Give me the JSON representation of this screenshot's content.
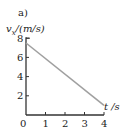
{
  "panel_label": "a)",
  "axes": {
    "ylabel_italic": "v",
    "ylabel_sub": "x",
    "ylabel_unit": "/(m/s)",
    "xlabel": "t /s"
  },
  "colors": {
    "axis": "#333333",
    "line": "#a0a0a0"
  },
  "chart_data": {
    "type": "line",
    "title": "a)",
    "xlabel": "t /s",
    "ylabel": "v_x /(m/s)",
    "xlim": [
      0,
      4
    ],
    "ylim": [
      0,
      8
    ],
    "xticks": [
      0,
      1,
      2,
      3,
      4
    ],
    "yticks": [
      2,
      4,
      6,
      8
    ],
    "grid": false,
    "legend": null,
    "series": [
      {
        "name": "v_x(t)",
        "x": [
          0,
          4
        ],
        "y": [
          7.5,
          1.0
        ]
      }
    ]
  }
}
